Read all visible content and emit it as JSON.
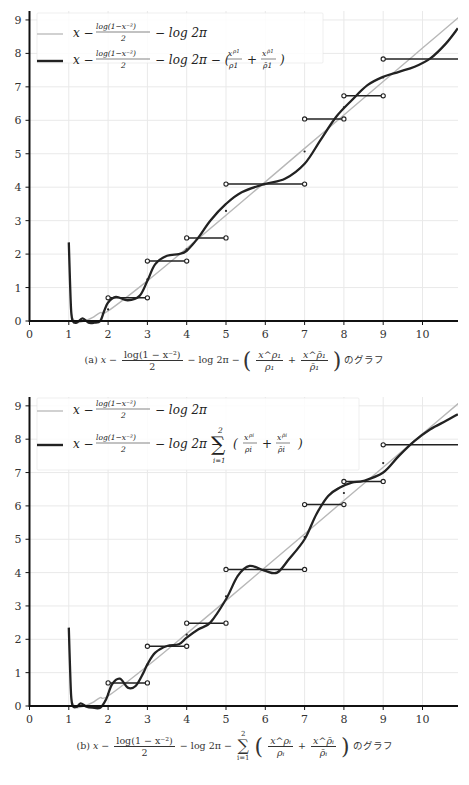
{
  "figures": [
    {
      "id": "a",
      "caption_label": "(a)",
      "caption_formula": "x − log(1 − x^−2)/2 − log 2π − (x^ρ1/ρ1 + x^ρ̄1/ρ̄1)",
      "caption_suffix": "のグラフ",
      "legend": [
        {
          "label": "x − log(1−x^−2)/2 − log 2π",
          "color": "#b8b8b8",
          "width": 1.3
        },
        {
          "label": "x − log(1−x^−2)/2 − log 2π − (x^ρ1/ρ1 + x^ρ̄1/ρ̄1)",
          "color": "#222222",
          "width": 2.4
        }
      ]
    },
    {
      "id": "b",
      "caption_label": "(b)",
      "caption_formula": "x − log(1 − x^−2)/2 − log 2π − Σ_{i=1}^{2} (x^ρi/ρi + x^ρ̄i/ρ̄i)",
      "caption_suffix": "のグラフ",
      "legend": [
        {
          "label": "x − log(1−x^−2)/2 − log 2π",
          "color": "#b8b8b8",
          "width": 1.3
        },
        {
          "label": "x − log(1−x^−2)/2 − log 2π − Σ_{i=1}^{2}(x^ρi/ρi + x^ρ̄i/ρ̄i)",
          "color": "#222222",
          "width": 2.4
        }
      ]
    }
  ],
  "caption_a": {
    "label": "(a)",
    "x": "x",
    "minus": "−",
    "log_num": "log(1 − x⁻²)",
    "log_den": "2",
    "log2pi": "− log 2π −",
    "f1_num": "x^ρ₁",
    "f1_den": "ρ₁",
    "plus": "+",
    "f2_num": "x^ρ̄₁",
    "f2_den": "ρ̄₁",
    "suffix": "のグラフ"
  },
  "caption_b": {
    "label": "(b)",
    "x": "x",
    "minus": "−",
    "log_num": "log(1 − x⁻²)",
    "log_den": "2",
    "log2pi": "− log 2π −",
    "sum_upper": "2",
    "sum_lower": "i=1",
    "sum_symbol": "∑",
    "f1_num": "x^ρᵢ",
    "f1_den": "ρᵢ",
    "plus": "+",
    "f2_num": "x^ρ̄ᵢ",
    "f2_den": "ρ̄ᵢ",
    "suffix": "のグラフ"
  },
  "chart_data": [
    {
      "type": "line",
      "title": "(a) x − log(1−x^−2)/2 − log 2π − (x^ρ1/ρ1 + x^ρ̄1/ρ̄1) のグラフ",
      "xlabel": "",
      "ylabel": "",
      "xlim": [
        0,
        11
      ],
      "ylim": [
        0,
        9
      ],
      "xticks": [
        0,
        1,
        2,
        3,
        4,
        5,
        6,
        7,
        8,
        9,
        10
      ],
      "yticks": [
        0,
        1,
        2,
        3,
        4,
        5,
        6,
        7,
        8,
        9
      ],
      "grid": true,
      "legend_position": "upper left",
      "series": [
        {
          "name": "x − log(1−x^−2)/2 − log 2π",
          "color": "#b8b8b8",
          "x": [
            1.05,
            1.1,
            1.2,
            1.4,
            1.6,
            1.8,
            2,
            3,
            4,
            5,
            6,
            7,
            8,
            9,
            10,
            11
          ],
          "y": [
            0.3,
            0.08,
            -0.05,
            0.0,
            0.1,
            0.25,
            0.3,
            1.2,
            2.17,
            3.16,
            4.16,
            5.16,
            6.16,
            7.16,
            8.16,
            9.16
          ]
        },
        {
          "name": "x − log(1−x^−2)/2 − log 2π − (x^ρ1/ρ1 + x^ρ̄1/ρ̄1)",
          "color": "#222222",
          "x": [
            1.0,
            1.03,
            1.06,
            1.1,
            1.2,
            1.35,
            1.5,
            1.65,
            1.8,
            1.9,
            2.0,
            2.2,
            2.5,
            2.8,
            3.0,
            3.2,
            3.5,
            3.8,
            4.0,
            4.3,
            4.6,
            5.0,
            5.4,
            6.0,
            6.5,
            7.0,
            7.4,
            7.8,
            8.2,
            8.6,
            9.0,
            9.4,
            9.8,
            10.2,
            10.6,
            10.9
          ],
          "y": [
            2.35,
            1.2,
            0.3,
            0.0,
            -0.05,
            0.08,
            -0.05,
            -0.05,
            0.0,
            0.3,
            0.55,
            0.72,
            0.62,
            0.75,
            1.2,
            1.7,
            1.95,
            2.0,
            2.1,
            2.5,
            3.0,
            3.5,
            3.85,
            4.1,
            4.25,
            4.7,
            5.4,
            6.1,
            6.6,
            7.05,
            7.3,
            7.45,
            7.6,
            7.85,
            8.3,
            8.75
          ]
        }
      ],
      "step_function": {
        "name": "ψ(x) staircase",
        "color": "#222222",
        "segments": [
          {
            "x0": 2,
            "x1": 3,
            "y": 0.693
          },
          {
            "x0": 3,
            "x1": 4,
            "y": 1.792
          },
          {
            "x0": 4,
            "x1": 5,
            "y": 2.485
          },
          {
            "x0": 5,
            "x1": 7,
            "y": 4.094
          },
          {
            "x0": 7,
            "x1": 8,
            "y": 6.04
          },
          {
            "x0": 8,
            "x1": 9,
            "y": 6.733
          },
          {
            "x0": 9,
            "x1": 11,
            "y": 7.832
          }
        ],
        "midpoints": [
          {
            "x": 2,
            "y": 0.347
          },
          {
            "x": 3,
            "y": 1.243
          },
          {
            "x": 4,
            "y": 2.139
          },
          {
            "x": 5,
            "y": 3.29
          },
          {
            "x": 7,
            "y": 5.067
          },
          {
            "x": 8,
            "y": 6.387
          },
          {
            "x": 9,
            "y": 7.283
          }
        ]
      }
    },
    {
      "type": "line",
      "title": "(b) x − log(1−x^−2)/2 − log 2π − Σ_{i=1}^{2}(x^ρi/ρi + x^ρ̄i/ρ̄i) のグラフ",
      "xlabel": "",
      "ylabel": "",
      "xlim": [
        0,
        11
      ],
      "ylim": [
        0,
        9
      ],
      "xticks": [
        0,
        1,
        2,
        3,
        4,
        5,
        6,
        7,
        8,
        9,
        10
      ],
      "yticks": [
        0,
        1,
        2,
        3,
        4,
        5,
        6,
        7,
        8,
        9
      ],
      "grid": true,
      "legend_position": "upper left",
      "series": [
        {
          "name": "x − log(1−x^−2)/2 − log 2π",
          "color": "#b8b8b8",
          "x": [
            1.05,
            1.1,
            1.2,
            1.4,
            1.6,
            1.8,
            2,
            3,
            4,
            5,
            6,
            7,
            8,
            9,
            10,
            11
          ],
          "y": [
            0.3,
            0.08,
            -0.05,
            0.0,
            0.1,
            0.25,
            0.3,
            1.2,
            2.17,
            3.16,
            4.16,
            5.16,
            6.16,
            7.16,
            8.16,
            9.16
          ]
        },
        {
          "name": "x − log(1−x^−2)/2 − log 2π − Σ_{i=1}^{2}(x^ρi/ρi + x^ρ̄i/ρ̄i)",
          "color": "#222222",
          "x": [
            1.0,
            1.03,
            1.06,
            1.1,
            1.2,
            1.3,
            1.45,
            1.6,
            1.8,
            1.95,
            2.1,
            2.3,
            2.5,
            2.7,
            2.9,
            3.0,
            3.2,
            3.5,
            3.8,
            4.0,
            4.3,
            4.6,
            5.0,
            5.3,
            5.6,
            6.0,
            6.3,
            6.6,
            7.0,
            7.3,
            7.6,
            7.9,
            8.2,
            8.5,
            9.0,
            9.4,
            9.8,
            10.2,
            10.6,
            10.9
          ],
          "y": [
            2.35,
            1.2,
            0.3,
            0.0,
            -0.03,
            0.08,
            -0.02,
            -0.05,
            -0.05,
            0.2,
            0.65,
            0.82,
            0.55,
            0.6,
            1.0,
            1.25,
            1.6,
            1.8,
            1.85,
            2.05,
            2.3,
            2.5,
            3.2,
            3.9,
            4.2,
            4.05,
            4.0,
            4.4,
            5.0,
            5.75,
            6.3,
            6.55,
            6.7,
            6.75,
            7.0,
            7.5,
            7.95,
            8.3,
            8.55,
            8.75
          ]
        }
      ],
      "step_function": {
        "name": "ψ(x) staircase",
        "color": "#222222",
        "segments": [
          {
            "x0": 2,
            "x1": 3,
            "y": 0.693
          },
          {
            "x0": 3,
            "x1": 4,
            "y": 1.792
          },
          {
            "x0": 4,
            "x1": 5,
            "y": 2.485
          },
          {
            "x0": 5,
            "x1": 7,
            "y": 4.094
          },
          {
            "x0": 7,
            "x1": 8,
            "y": 6.04
          },
          {
            "x0": 8,
            "x1": 9,
            "y": 6.733
          },
          {
            "x0": 9,
            "x1": 11,
            "y": 7.832
          }
        ],
        "midpoints": [
          {
            "x": 2,
            "y": 0.347
          },
          {
            "x": 3,
            "y": 1.243
          },
          {
            "x": 4,
            "y": 2.139
          },
          {
            "x": 5,
            "y": 3.29
          },
          {
            "x": 7,
            "y": 5.067
          },
          {
            "x": 8,
            "y": 6.387
          },
          {
            "x": 9,
            "y": 7.283
          }
        ]
      }
    }
  ],
  "layout": {
    "plots": [
      {
        "x0_px": 29.5,
        "x_unit_px": 39.3,
        "y0_px": 321,
        "y_unit_px": 33.45,
        "x_axis_end_px": 458,
        "y_axis_top_px": 11
      },
      {
        "x0_px": 29.5,
        "x_unit_px": 39.3,
        "y0_px": 321,
        "y_unit_px": 33.35,
        "x_axis_end_px": 458,
        "y_axis_top_px": 12
      }
    ]
  }
}
